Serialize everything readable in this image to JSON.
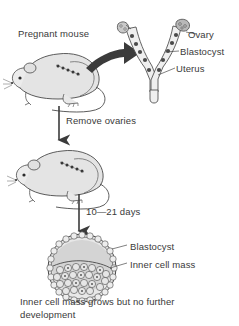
{
  "figure": {
    "background_color": "#ffffff",
    "ink_color": "#3a3a3a",
    "fill_gray": "#dcdcdc",
    "arrow_color": "#3b3b3b",
    "width": 239,
    "height": 326
  },
  "labels": {
    "pregnant_mouse": "Pregnant mouse",
    "ovary": "Ovary",
    "blastocyst_top": "Blastocyst",
    "uterus": "Uterus",
    "remove_ovaries": "Remove ovaries",
    "days": "10—21 days",
    "blastocyst_bottom": "Blastocyst",
    "inner_cell_mass": "Inner cell mass"
  },
  "caption": "Inner cell mass grows but no further development",
  "icons": {
    "mouse_top": "pregnant-mouse-illustration",
    "mouse_bottom": "ovariectomized-mouse-illustration",
    "uterus": "y-shaped-uterus-illustration",
    "blastocyst": "blastocyst-cross-section-illustration",
    "curved_arrow": "curved-arrow-right",
    "down_arrow_1": "arrow-down",
    "down_arrow_2": "arrow-down"
  }
}
